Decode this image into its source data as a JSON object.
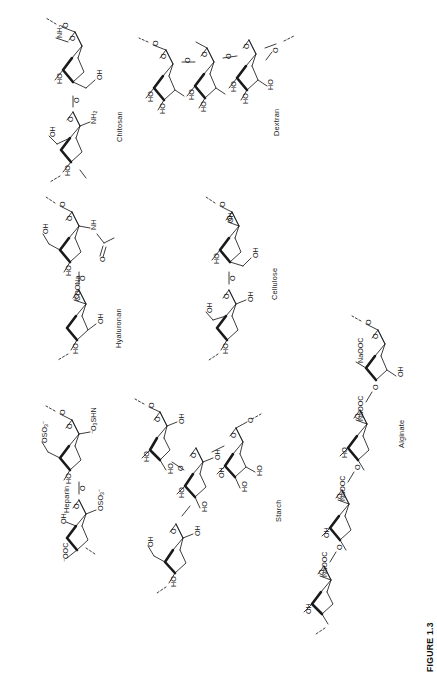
{
  "figure": {
    "caption": "FIGURE 1.3",
    "background_color": "#ffffff",
    "line_color": "#1a1a1a",
    "orientation": "rotated-90-ccw",
    "width": 437,
    "height": 681
  },
  "structures": [
    {
      "id": "heparin",
      "label": "Heparin",
      "label_x": 62,
      "label_y": 513,
      "units": 2,
      "atom_labels": [
        "OSO3-",
        "-O3SHN",
        "HO",
        "O",
        "OSO3-",
        "OH",
        "-OOC",
        "O"
      ]
    },
    {
      "id": "hyaluronan",
      "label": "Hyaluronan",
      "label_x": 114,
      "label_y": 348,
      "units": 2,
      "atom_labels": [
        "O",
        "NH",
        "O",
        "OH",
        "HO",
        "COONa",
        "OH",
        "HO",
        "O"
      ]
    },
    {
      "id": "chitosan",
      "label": "Chitosan",
      "label_x": 115,
      "label_y": 142,
      "units": 2,
      "atom_labels": [
        "NH2",
        "O",
        "OH",
        "HO",
        "O",
        "NH2",
        "OH",
        "HO"
      ]
    },
    {
      "id": "starch",
      "label": "Starch",
      "label_x": 274,
      "label_y": 522,
      "units": 4,
      "atom_labels": [
        "OH",
        "HO",
        "O",
        "OH",
        "HO",
        "O",
        "OH",
        "HO",
        "O",
        "OH",
        "HO"
      ]
    },
    {
      "id": "cellulose",
      "label": "Cellulose",
      "label_x": 270,
      "label_y": 300,
      "units": 2,
      "atom_labels": [
        "O",
        "OH",
        "OH",
        "HO",
        "O",
        "OH",
        "OH",
        "HO"
      ]
    },
    {
      "id": "dextran",
      "label": "Dextran",
      "label_x": 272,
      "label_y": 136,
      "units": 3,
      "atom_labels": [
        "O",
        "HO",
        "HO",
        "HO",
        "O",
        "HO",
        "HO",
        "HO",
        "O",
        "HO",
        "HO",
        "HO"
      ]
    },
    {
      "id": "alginate",
      "label": "Alginate",
      "label_x": 397,
      "label_y": 448,
      "units": 4,
      "atom_labels": [
        "NaOOC",
        "OH",
        "OH",
        "NaOOC",
        "O",
        "NaOOC",
        "HO",
        "HO",
        "NaOOC",
        "OH",
        "OH",
        "O"
      ]
    }
  ],
  "atom_text": {
    "OH": "OH",
    "HO": "HO",
    "O": "O",
    "NH": "NH",
    "NH2": "NH2",
    "COONa": "COONa",
    "NaOOC": "NaOOC",
    "OSO3": "OSO3",
    "O3SHN": "O3SHN",
    "OOC": "OOC"
  }
}
